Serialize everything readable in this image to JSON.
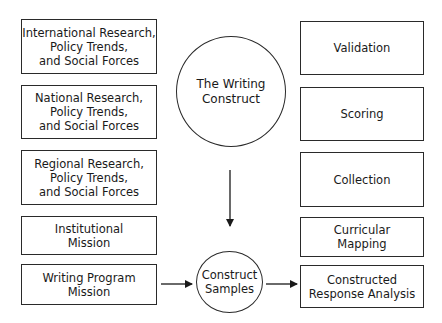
{
  "left_boxes": [
    {
      "label": "International Research,\nPolicy Trends,\nand Social Forces"
    },
    {
      "label": "National Research,\nPolicy Trends,\nand Social Forces"
    },
    {
      "label": "Regional Research,\nPolicy Trends,\nand Social Forces"
    },
    {
      "label": "Institutional\nMission"
    },
    {
      "label": "Writing Program\nMission"
    }
  ],
  "center": {
    "writing_construct": "The Writing\nConstruct",
    "construct_samples": "Construct\nSamples"
  },
  "right_boxes": [
    {
      "label": "Validation"
    },
    {
      "label": "Scoring"
    },
    {
      "label": "Collection"
    },
    {
      "label": "Curricular\nMapping"
    },
    {
      "label": "Constructed\nResponse Analysis"
    }
  ],
  "colors": {
    "stroke": "#2a2a2a",
    "background": "#ffffff"
  }
}
